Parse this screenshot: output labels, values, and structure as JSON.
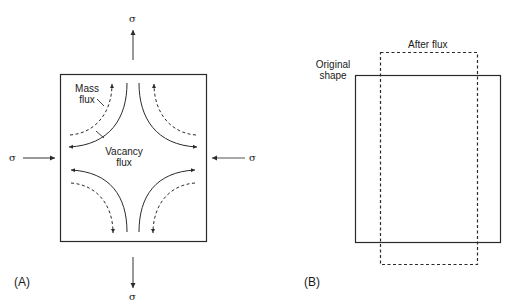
{
  "panel_a": {
    "label": "(A)",
    "stress_symbol": "σ",
    "mass_flux_label_line1": "Mass",
    "mass_flux_label_line2": "flux",
    "vacancy_flux_label_line1": "Vacancy",
    "vacancy_flux_label_line2": "flux"
  },
  "panel_b": {
    "label": "(B)",
    "original_label_line1": "Original",
    "original_label_line2": "shape",
    "after_label": "After flux"
  },
  "colors": {
    "stroke": "#2a2a2a",
    "arrow": "#555555",
    "background": "#ffffff"
  }
}
